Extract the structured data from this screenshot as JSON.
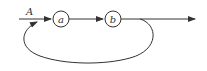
{
  "diagram": {
    "type": "signal-flow",
    "input_label": "A",
    "nodes": [
      {
        "id": "a",
        "label": "a"
      },
      {
        "id": "b",
        "label": "b"
      }
    ],
    "edges": [
      {
        "from": "input",
        "to": "a",
        "label": "A"
      },
      {
        "from": "a",
        "to": "b"
      },
      {
        "from": "b",
        "to": "output"
      },
      {
        "from": "b-output",
        "to": "a-input",
        "type": "feedback-loop"
      }
    ],
    "colors": {
      "stroke": "#333333",
      "background": "#ffffff"
    }
  }
}
